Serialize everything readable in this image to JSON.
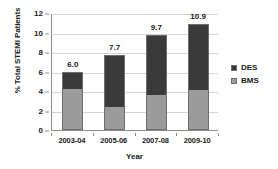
{
  "chart_data": {
    "type": "bar",
    "subtype": "stacked-bar",
    "title": "",
    "xlabel": "Year",
    "ylabel": "% Total STEMI Patients",
    "categories": [
      "2003-04",
      "2005-06",
      "2007-08",
      "2009-10"
    ],
    "series": [
      {
        "name": "BMS",
        "values": [
          4.2,
          2.3,
          3.6,
          4.1
        ],
        "color": "#9b9b9b"
      },
      {
        "name": "DES",
        "values": [
          1.8,
          5.4,
          6.1,
          6.8
        ],
        "color": "#3a3a3a"
      }
    ],
    "totals": [
      6.0,
      7.7,
      9.7,
      10.9
    ],
    "data_labels": [
      "6.0",
      "7.7",
      "9.7",
      "10.9"
    ],
    "ylim": [
      0,
      12
    ],
    "ytick_labels": [
      "0",
      "2",
      "4",
      "6",
      "8",
      "10",
      "12"
    ],
    "ytick_values": [
      0,
      2,
      4,
      6,
      8,
      10,
      12
    ],
    "grid": true,
    "grid_axis": "y",
    "legend_position": "right",
    "legend_entries": [
      "DES",
      "BMS"
    ]
  },
  "colors": {
    "des": "#3a3a3a",
    "bms": "#9b9b9b",
    "axis": "#8c8c8c",
    "grid": "#d4d4d4",
    "bar_border": "#6e6e6e",
    "background": "#ffffff",
    "text": "#1a1a1a"
  }
}
